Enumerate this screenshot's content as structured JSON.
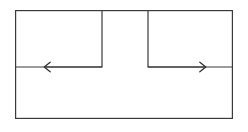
{
  "figure": {
    "canvas": {
      "width": 248,
      "height": 132,
      "background": "#ffffff"
    },
    "style": {
      "line_color": "#3a3a3a",
      "line_width": 1.2,
      "arrow_color": "#2b2b2b",
      "arrow_width": 1.2
    },
    "geometry": {
      "outer_rect": {
        "x": 15,
        "y": 10,
        "width": 218,
        "height": 109
      },
      "left_box": {
        "x": 15,
        "y": 10,
        "width": 87,
        "height": 57
      },
      "right_box": {
        "x": 148,
        "y": 10,
        "width": 85,
        "height": 57
      },
      "gap_between_boxes": {
        "x_start": 102,
        "x_end": 148,
        "width": 46
      },
      "divider_y": 67
    },
    "arrows": [
      {
        "name": "left-arrow",
        "direction": "left",
        "label": "",
        "start_x": 102,
        "end_x": 45,
        "y": 67,
        "head_size": 6
      },
      {
        "name": "right-arrow",
        "direction": "right",
        "label": "",
        "start_x": 148,
        "end_x": 205,
        "y": 67,
        "head_size": 6
      }
    ],
    "labels": []
  }
}
